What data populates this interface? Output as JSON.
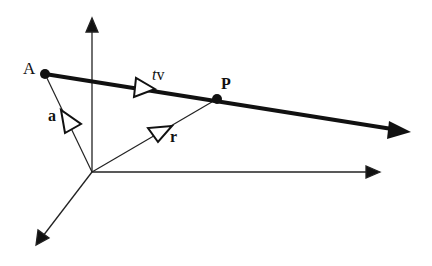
{
  "diagram": {
    "type": "vector line equation diagram",
    "colors": {
      "stroke": "#111111",
      "background": "#ffffff"
    },
    "points": {
      "origin": {
        "x": 92,
        "y": 172
      },
      "A": {
        "label": "A",
        "x": 45,
        "y": 74
      },
      "P": {
        "label": "P",
        "x": 217,
        "y": 99
      }
    },
    "axes": [
      {
        "name": "z-axis",
        "from": [
          92,
          172
        ],
        "to": [
          92,
          18
        ]
      },
      {
        "name": "y-axis",
        "from": [
          92,
          172
        ],
        "to": [
          380,
          172
        ]
      },
      {
        "name": "x-axis",
        "from": [
          92,
          172
        ],
        "to": [
          36,
          245
        ]
      }
    ],
    "line": {
      "name": "line-through-A-along-v",
      "from": [
        45,
        74
      ],
      "to": [
        410,
        132
      ]
    },
    "vectors": [
      {
        "name": "a",
        "label": "a",
        "from": "origin",
        "to": "A"
      },
      {
        "name": "r",
        "label": "r",
        "from": "origin",
        "to": "P"
      },
      {
        "name": "tv",
        "label_t": "t",
        "label_v": "v",
        "from": "A",
        "to": "P"
      }
    ],
    "labels": {
      "A": "A",
      "P": "P",
      "a": "a",
      "r": "r",
      "t": "t",
      "v": "v"
    }
  }
}
